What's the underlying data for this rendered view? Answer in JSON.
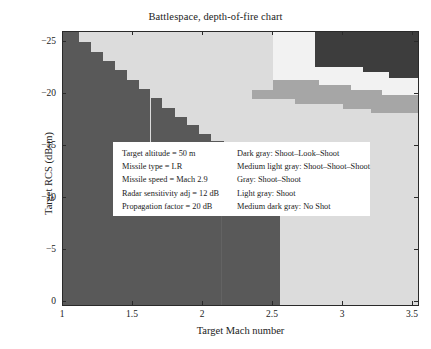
{
  "chart_data": {
    "type": "heatmap",
    "title": "Battlespace, depth-of-fire chart",
    "xlabel": "Target Mach number",
    "ylabel": "Target RCS (dBsm)",
    "xlim": [
      1.0,
      3.55
    ],
    "ylim": [
      -26.0,
      0.5
    ],
    "y_inverted": true,
    "grid": false,
    "xticks": [
      1,
      1.5,
      2,
      2.5,
      3,
      3.5
    ],
    "xticklabels": [
      "1",
      "1.5",
      "2",
      "2.5",
      "3",
      "3.5"
    ],
    "yticks": [
      -25,
      -20,
      -15,
      -10,
      -5,
      0
    ],
    "yticklabels": [
      "−25",
      "−20",
      "−15",
      "−10",
      "−5",
      "0"
    ],
    "categories": [
      "Shoot-Look-Shoot",
      "Shoot-Shoot-Shoot",
      "Shoot-Shoot",
      "Shoot",
      "No Shot"
    ],
    "colors": {
      "dark_gray": "#3d3d3d",
      "medium_light_gray": "#f2f2f2",
      "gray": "#a6a6a6",
      "light_gray": "#dcdcdc",
      "medium_dark_gray": "#595959",
      "axis": "#2a2a2a",
      "background": "#ffffff"
    },
    "regions": [
      {
        "label": "No Shot",
        "color": "#595959",
        "x0": 1.0,
        "x1": 2.55,
        "y0": -26.0,
        "y1": 0.5
      },
      {
        "label": "Shoot",
        "color": "#dcdcdc",
        "x0": 2.55,
        "x1": 3.55,
        "y0": -26.0,
        "y1": 0.5
      },
      {
        "label": "No Shot staircase",
        "color": "#595959",
        "x0": 1.0,
        "x1": 2.55,
        "y0": -26.0,
        "y1": -14.8
      },
      {
        "label": "Shoot-Shoot",
        "color": "#a6a6a6",
        "x0": 2.35,
        "x1": 3.55,
        "y0": -26.0,
        "y1": -19.5
      },
      {
        "label": "Shoot-Shoot-Shoot",
        "color": "#f2f2f2",
        "x0": 2.5,
        "x1": 3.55,
        "y0": -26.0,
        "y1": -21.5
      },
      {
        "label": "Shoot-Look-Shoot",
        "color": "#3d3d3d",
        "x0": 2.8,
        "x1": 3.55,
        "y0": -26.0,
        "y1": -22.5
      }
    ],
    "staircase_no_shot": [
      {
        "x0": 1.0,
        "x1": 1.115,
        "ytop": -26.0
      },
      {
        "x0": 1.115,
        "x1": 1.2,
        "ytop": -25.0
      },
      {
        "x0": 1.2,
        "x1": 1.285,
        "ytop": -24.1
      },
      {
        "x0": 1.285,
        "x1": 1.37,
        "ytop": -23.2
      },
      {
        "x0": 1.37,
        "x1": 1.455,
        "ytop": -22.3
      },
      {
        "x0": 1.455,
        "x1": 1.54,
        "ytop": -21.4
      },
      {
        "x0": 1.54,
        "x1": 1.625,
        "ytop": -20.5
      },
      {
        "x0": 1.625,
        "x1": 1.71,
        "ytop": -19.6
      },
      {
        "x0": 1.71,
        "x1": 1.8,
        "ytop": -18.7
      },
      {
        "x0": 1.8,
        "x1": 1.885,
        "ytop": -17.8
      },
      {
        "x0": 1.885,
        "x1": 1.97,
        "ytop": -17.0
      },
      {
        "x0": 1.97,
        "x1": 2.06,
        "ytop": -16.2
      },
      {
        "x0": 2.06,
        "x1": 2.15,
        "ytop": -15.5
      },
      {
        "x0": 2.15,
        "x1": 2.3,
        "ytop": -14.9
      },
      {
        "x0": 2.3,
        "x1": 2.55,
        "ytop": -14.4
      }
    ]
  },
  "legend": {
    "parameters": [
      "Target altitude = 50 m",
      "Missile type = LR",
      "Missile speed = Mach 2.9",
      "Radar sensitivity adj = 12 dB",
      "Propagation factor = 20 dB"
    ],
    "keys": [
      "Dark gray: Shoot–Look–Shoot",
      "Medium light gray: Shoot–Shoot–Shoot",
      "Gray: Shoot–Shoot",
      "Light gray: Shoot",
      "Medium dark gray: No Shot"
    ]
  }
}
